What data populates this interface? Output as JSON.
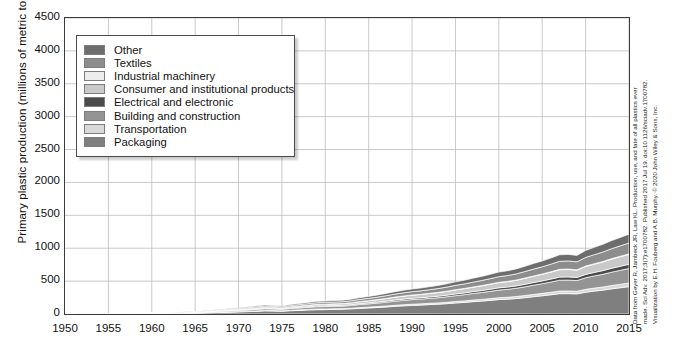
{
  "axes": {
    "ylabel": "Primary plastic production (millions of metric tons)",
    "yticks": [
      "4500",
      "4000",
      "3500",
      "3000",
      "2500",
      "2000",
      "1500",
      "1000",
      "500",
      "0"
    ],
    "xticks": [
      "1950",
      "1955",
      "1960",
      "1965",
      "1970",
      "1975",
      "1980",
      "1985",
      "1990",
      "1995",
      "2000",
      "2005",
      "2010",
      "2015"
    ]
  },
  "legend": {
    "items": [
      {
        "label": "Other",
        "color": "#6d6d6d"
      },
      {
        "label": "Textiles",
        "color": "#8d8d8d"
      },
      {
        "label": "Industrial machinery",
        "color": "#ededed"
      },
      {
        "label": "Consumer and institutional products",
        "color": "#c9c9c9"
      },
      {
        "label": "Electrical and electronic",
        "color": "#4b4b4b"
      },
      {
        "label": "Building and construction",
        "color": "#949494"
      },
      {
        "label": "Transportation",
        "color": "#d9d9d9"
      },
      {
        "label": "Packaging",
        "color": "#7f7f7f"
      }
    ]
  },
  "citation": {
    "line1": "Data from Geyer R, Jambeck JR, Law KL. Production, use, and fate of all plastics ever",
    "line2": "made. Sci Adv. 2017;3(7):e1700782. Published 2017 Jul 19. doi:10.1126/sciadv.1700782.",
    "line3": "Visualization by E.H. Fouberg and A.B. Murphy. © 2020 John Wiley & Sons, Inc."
  },
  "chart_data": {
    "type": "area",
    "title": "",
    "xlabel": "",
    "ylabel": "Primary plastic production (millions of metric tons)",
    "xlim": [
      1950,
      2015
    ],
    "ylim": [
      0,
      4500
    ],
    "ytick_step": 500,
    "xtick_step": 5,
    "grid": true,
    "legend_position": "upper-left-inside",
    "stacked": true,
    "stack_order_bottom_to_top": [
      "Packaging",
      "Transportation",
      "Building and construction",
      "Electrical and electronic",
      "Consumer and institutional products",
      "Industrial machinery",
      "Textiles",
      "Other"
    ],
    "x": [
      1950,
      1955,
      1960,
      1965,
      1970,
      1971,
      1972,
      1973,
      1974,
      1975,
      1976,
      1977,
      1978,
      1979,
      1980,
      1981,
      1982,
      1983,
      1984,
      1985,
      1986,
      1987,
      1988,
      1989,
      1990,
      1991,
      1992,
      1993,
      1994,
      1995,
      1996,
      1997,
      1998,
      1999,
      2000,
      2001,
      2002,
      2003,
      2004,
      2005,
      2006,
      2007,
      2008,
      2009,
      2010,
      2011,
      2012,
      2013,
      2014,
      2015
    ],
    "series": [
      {
        "name": "Packaging",
        "color": "#7f7f7f",
        "values": [
          0,
          2,
          6,
          13,
          32,
          36,
          41,
          47,
          45,
          42,
          50,
          55,
          61,
          66,
          67,
          70,
          72,
          78,
          86,
          92,
          99,
          107,
          116,
          124,
          131,
          136,
          143,
          149,
          157,
          168,
          176,
          187,
          196,
          207,
          219,
          225,
          235,
          248,
          263,
          277,
          292,
          309,
          310,
          306,
          331,
          348,
          363,
          382,
          399,
          416
        ]
      },
      {
        "name": "Transportation",
        "color": "#d9d9d9",
        "values": [
          0,
          0,
          1,
          2,
          5,
          6,
          6,
          7,
          7,
          6,
          7,
          8,
          9,
          10,
          10,
          10,
          10,
          11,
          12,
          13,
          14,
          15,
          16,
          17,
          18,
          18,
          19,
          20,
          21,
          22,
          23,
          25,
          26,
          27,
          29,
          30,
          31,
          33,
          35,
          37,
          39,
          41,
          41,
          40,
          44,
          46,
          48,
          51,
          53,
          55
        ]
      },
      {
        "name": "Building and construction",
        "color": "#949494",
        "values": [
          0,
          1,
          3,
          7,
          17,
          19,
          22,
          25,
          24,
          22,
          27,
          29,
          32,
          35,
          36,
          37,
          38,
          41,
          46,
          49,
          53,
          57,
          62,
          66,
          70,
          72,
          76,
          79,
          84,
          89,
          94,
          99,
          104,
          110,
          116,
          120,
          125,
          132,
          140,
          147,
          155,
          164,
          165,
          162,
          176,
          185,
          193,
          203,
          212,
          221
        ]
      },
      {
        "name": "Electrical and electronic",
        "color": "#4b4b4b",
        "values": [
          0,
          0,
          1,
          2,
          5,
          5,
          6,
          7,
          7,
          6,
          8,
          9,
          9,
          10,
          10,
          11,
          11,
          12,
          13,
          14,
          15,
          16,
          18,
          19,
          20,
          21,
          22,
          23,
          24,
          26,
          27,
          29,
          30,
          32,
          34,
          35,
          36,
          38,
          40,
          42,
          45,
          47,
          48,
          47,
          51,
          53,
          56,
          59,
          61,
          64
        ]
      },
      {
        "name": "Consumer and institutional products",
        "color": "#c9c9c9",
        "values": [
          0,
          1,
          2,
          5,
          12,
          13,
          15,
          17,
          16,
          15,
          18,
          20,
          22,
          24,
          25,
          25,
          26,
          28,
          31,
          33,
          36,
          39,
          42,
          45,
          47,
          49,
          51,
          54,
          57,
          61,
          64,
          67,
          71,
          75,
          79,
          81,
          85,
          90,
          95,
          100,
          105,
          111,
          112,
          110,
          119,
          125,
          131,
          138,
          144,
          150
        ]
      },
      {
        "name": "Industrial machinery",
        "color": "#ededed",
        "values": [
          0,
          0,
          0,
          0,
          1,
          1,
          1,
          1,
          1,
          1,
          1,
          1,
          1,
          2,
          2,
          2,
          2,
          2,
          2,
          2,
          2,
          3,
          3,
          3,
          3,
          3,
          3,
          4,
          4,
          4,
          4,
          4,
          5,
          5,
          5,
          5,
          5,
          6,
          6,
          6,
          7,
          7,
          7,
          7,
          8,
          8,
          8,
          9,
          9,
          9
        ]
      },
      {
        "name": "Textiles",
        "color": "#8d8d8d",
        "values": [
          0,
          1,
          2,
          5,
          12,
          14,
          16,
          18,
          17,
          16,
          19,
          21,
          23,
          25,
          26,
          27,
          28,
          30,
          33,
          35,
          38,
          41,
          45,
          48,
          51,
          53,
          56,
          58,
          62,
          66,
          69,
          73,
          77,
          81,
          86,
          89,
          93,
          98,
          104,
          109,
          115,
          122,
          123,
          121,
          131,
          137,
          144,
          151,
          158,
          165
        ]
      },
      {
        "name": "Other",
        "color": "#6d6d6d",
        "values": [
          0,
          1,
          2,
          4,
          10,
          11,
          13,
          15,
          14,
          13,
          16,
          17,
          19,
          20,
          21,
          22,
          23,
          24,
          27,
          29,
          31,
          34,
          37,
          39,
          41,
          43,
          45,
          47,
          50,
          53,
          56,
          60,
          63,
          66,
          70,
          72,
          76,
          80,
          85,
          89,
          94,
          99,
          100,
          98,
          106,
          112,
          117,
          123,
          128,
          134
        ]
      }
    ],
    "totals": [
      0,
      6,
      17,
      38,
      94,
      105,
      120,
      137,
      131,
      121,
      146,
      160,
      176,
      192,
      197,
      204,
      210,
      226,
      250,
      267,
      288,
      312,
      339,
      361,
      381,
      395,
      415,
      434,
      459,
      489,
      513,
      544,
      572,
      603,
      638,
      657,
      686,
      725,
      768,
      807,
      852,
      900,
      906,
      891,
      966,
      1014,
      1060,
      1116,
      1164,
      1214
    ]
  }
}
